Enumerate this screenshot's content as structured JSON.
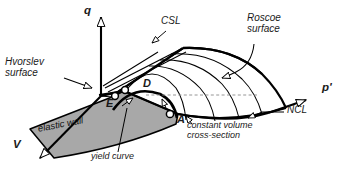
{
  "figure": {
    "type": "technical-diagram",
    "background_color": "#ffffff",
    "line_color": "#000000",
    "fill_color": "#a8a8a8",
    "dashed_color": "#8a8a8a"
  },
  "axes": [
    {
      "id": "q",
      "label": "q",
      "direction": "up",
      "label_x": 84,
      "label_y": 6
    },
    {
      "id": "p",
      "label": "p'",
      "direction": "right",
      "label_x": 322,
      "label_y": 84
    },
    {
      "id": "V",
      "label": "V",
      "direction": "down-left",
      "label_x": 14,
      "label_y": 141
    }
  ],
  "points": [
    {
      "id": "D",
      "label": "D",
      "x": 144,
      "y": 84,
      "marker_x": 125,
      "marker_y": 90
    },
    {
      "id": "E",
      "label": "E",
      "x": 107,
      "y": 104,
      "marker_x": 115,
      "marker_y": 96
    },
    {
      "id": "A",
      "label": "A",
      "x": 177,
      "y": 120,
      "marker_x": 170,
      "marker_y": 114
    }
  ],
  "annotations": [
    {
      "id": "csl",
      "text": "CSL",
      "x": 162,
      "y": 21,
      "leader": true,
      "description": "Critical State Line"
    },
    {
      "id": "roscoe-surface",
      "text": "Roscoe\nsurface",
      "line1": "Roscoe",
      "line2": "surface",
      "x": 248,
      "y": 18,
      "leader": true
    },
    {
      "id": "hvorslev-surface",
      "text": "Hvorslev\nsurface",
      "line1": "Hvorslev",
      "line2": "surface",
      "x": 6,
      "y": 61,
      "leader": true
    },
    {
      "id": "ncl",
      "text": "NCL",
      "x": 288,
      "y": 110,
      "leader": true,
      "description": "Normal Compression Line"
    },
    {
      "id": "constant-volume-cross-section",
      "text": "constant volume\ncross-section",
      "line1": "constant volume",
      "line2": "cross-section",
      "x": 188,
      "y": 125,
      "leader": true
    },
    {
      "id": "yield-curve",
      "text": "yield curve",
      "x": 92,
      "y": 156,
      "leader": true
    },
    {
      "id": "elastic-wall",
      "text": "elastic wall",
      "x": 38,
      "y": 128,
      "leader": false,
      "rotation": -11
    }
  ]
}
